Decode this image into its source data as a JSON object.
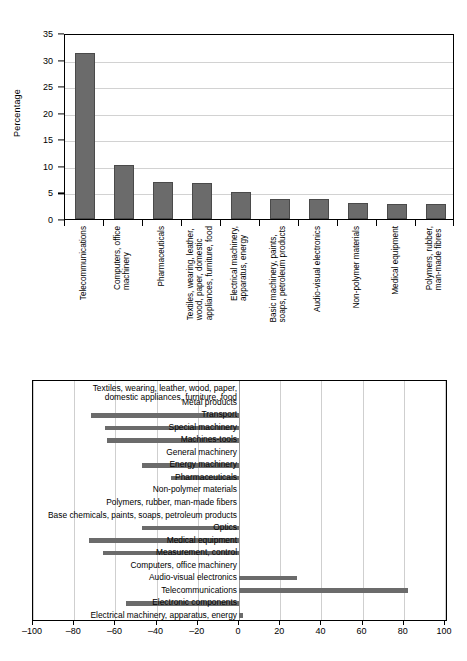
{
  "chart_data": [
    {
      "type": "bar",
      "id": "top-chart",
      "title": "",
      "xlabel": "",
      "ylabel": "Percentage",
      "orientation": "vertical",
      "ylim": [
        0,
        35
      ],
      "yticks": [
        0,
        5,
        10,
        15,
        20,
        25,
        30,
        35
      ],
      "grid": true,
      "legend": "none",
      "bar_color": "#6b6b6b",
      "categories": [
        "Telecommunications",
        "Computers, office machinery",
        "Pharmaceuticals",
        "Textiles, wearing, leather, wood, paper, domestic appliances, furniture, food",
        "Electrical machinery, apparatus, energy",
        "Basic machinery, paints, soaps, petroleum products",
        "Audio-visual electronics",
        "Non-polymer materials",
        "Medical equipment",
        "Polymers, rubber, man-made fibres"
      ],
      "category_lines": [
        [
          "Telecommunications"
        ],
        [
          "Computers, office",
          "machinery"
        ],
        [
          "Pharmaceuticals"
        ],
        [
          "Textiles, wearing, leather,",
          "wood, paper, domestic",
          "appliances, furniture, food"
        ],
        [
          "Electrical machinery,",
          "apparatus, energy"
        ],
        [
          "Basic machinery, paints,",
          "soaps, petroleum products"
        ],
        [
          "Audio-visual electronics"
        ],
        [
          "Non-polymer materials"
        ],
        [
          "Medical equipment"
        ],
        [
          "Polymers, rubber,",
          "man-made fibres"
        ]
      ],
      "values": [
        31.2,
        10.1,
        7.0,
        6.7,
        5.0,
        3.7,
        3.7,
        3.0,
        2.8,
        2.8
      ]
    },
    {
      "type": "bar",
      "id": "bottom-chart",
      "title": "",
      "xlabel": "",
      "ylabel": "",
      "orientation": "horizontal",
      "xlim": [
        -100,
        100
      ],
      "xticks": [
        -100,
        -80,
        -60,
        -40,
        -20,
        0,
        20,
        40,
        60,
        80,
        100
      ],
      "xtick_labels": [
        "–100",
        "–80",
        "–60",
        "–40",
        "–20",
        "0",
        "20",
        "40",
        "60",
        "80",
        "100"
      ],
      "grid": true,
      "legend": "none",
      "bar_color": "#6b6b6b",
      "categories": [
        "Textiles, wearing, leather, wood, paper, domestic appliances, furniture, food",
        "Metal products",
        "Transport",
        "Special machinery",
        "Machines-tools",
        "General machinery",
        "Energy machinery",
        "Pharmaceuticals",
        "Non-polymer materials",
        "Polymers, rubber, man-made fibers",
        "Base chemicals, paints, soaps, petroleum products",
        "Optics",
        "Medical equipment",
        "Measurement, control",
        "Computers, office machinery",
        "Audio-visual electronics",
        "Telecommunications",
        "Electronic components",
        "Electrical machinery, apparatus, energy"
      ],
      "category_lines": [
        [
          "Textiles, wearing, leather, wood, paper,",
          "domestic appliances, furniture, food"
        ],
        [
          "Metal products"
        ],
        [
          "Transport"
        ],
        [
          "Special machinery"
        ],
        [
          "Machines-tools"
        ],
        [
          "General machinery"
        ],
        [
          "Energy machinery"
        ],
        [
          "Pharmaceuticals"
        ],
        [
          "Non-polymer materials"
        ],
        [
          "Polymers, rubber, man-made fibers"
        ],
        [
          "Base chemicals, paints, soaps, petroleum products"
        ],
        [
          "Optics"
        ],
        [
          "Medical equipment"
        ],
        [
          "Measurement, control"
        ],
        [
          "Computers, office machinery"
        ],
        [
          "Audio-visual electronics"
        ],
        [
          "Telecommunications"
        ],
        [
          "Electronic components"
        ],
        [
          "Electrical machinery, apparatus, energy"
        ]
      ],
      "values": [
        0,
        0,
        -72,
        -65,
        -64,
        0,
        -47,
        -33,
        0,
        0,
        0,
        -47,
        -73,
        -66,
        0,
        28,
        82,
        -55,
        2
      ]
    }
  ]
}
